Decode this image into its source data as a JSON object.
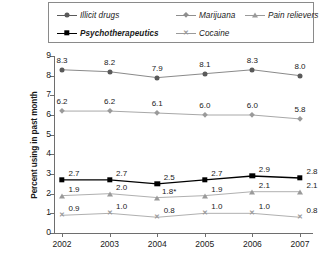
{
  "legend": {
    "items": [
      {
        "label": "Illicit drugs",
        "marker": "circle",
        "color": "#5a5a5a",
        "bold": false,
        "row": 1,
        "left": 8
      },
      {
        "label": "Marijuana",
        "marker": "diamond",
        "color": "#8e8e8e",
        "bold": false,
        "row": 1,
        "left": 127
      },
      {
        "label": "Pain relievers",
        "marker": "triangle",
        "color": "#9a9a9a",
        "bold": false,
        "row": 1,
        "left": 196
      },
      {
        "label": "Psychotherapeutics",
        "marker": "square",
        "color": "#000000",
        "bold": true,
        "row": 2,
        "left": 8
      },
      {
        "label": "Cocaine",
        "marker": "x",
        "color": "#9a9a9a",
        "bold": false,
        "row": 2,
        "left": 127
      }
    ]
  },
  "chart_data": {
    "type": "line",
    "title": "",
    "xlabel": "",
    "ylabel": "Percent using in past month",
    "categories": [
      "2002",
      "2003",
      "2004",
      "2005",
      "2006",
      "2007"
    ],
    "ylim": [
      0,
      9
    ],
    "yticks": [
      "0",
      "1",
      "2",
      "3",
      "4",
      "5",
      "6",
      "7",
      "8",
      "9"
    ],
    "grid": false,
    "legend_position": "top",
    "footnote_symbol": "*",
    "series": [
      {
        "name": "Illicit drugs",
        "marker": "circle",
        "color": "#5a5a5a",
        "line_color": "#8a8a8a",
        "values": [
          8.3,
          8.2,
          7.9,
          8.1,
          8.3,
          8.0
        ],
        "labels": [
          "8.3",
          "8.2",
          "7.9",
          "8.1",
          "8.3",
          "8.0"
        ],
        "label_side": "above"
      },
      {
        "name": "Marijuana",
        "marker": "diamond",
        "color": "#9a9a9a",
        "line_color": "#a8a8a8",
        "values": [
          6.2,
          6.2,
          6.1,
          6.0,
          6.0,
          5.8
        ],
        "labels": [
          "6.2",
          "6.2",
          "6.1",
          "6.0",
          "6.0",
          "5.8"
        ],
        "label_side": "above"
      },
      {
        "name": "Psychotherapeutics",
        "marker": "square",
        "color": "#000000",
        "line_color": "#000000",
        "values": [
          2.7,
          2.7,
          2.5,
          2.7,
          2.9,
          2.8
        ],
        "labels": [
          "2.7",
          "2.7",
          "2.5",
          "2.7",
          "2.9",
          "2.8"
        ],
        "label_side": "above-right"
      },
      {
        "name": "Pain relievers",
        "marker": "triangle",
        "color": "#9a9a9a",
        "line_color": "#b0b0b0",
        "values": [
          1.9,
          2.0,
          1.8,
          1.9,
          2.1,
          2.1
        ],
        "labels": [
          "1.9",
          "2.0",
          "1.8*",
          "1.9",
          "2.1",
          "2.1"
        ],
        "label_side": "above-right"
      },
      {
        "name": "Cocaine",
        "marker": "x",
        "color": "#9a9a9a",
        "line_color": "#b0b0b0",
        "values": [
          0.9,
          1.0,
          0.8,
          1.0,
          1.0,
          0.8
        ],
        "labels": [
          "0.9",
          "1.0",
          "0.8",
          "1.0",
          "1.0",
          "0.8"
        ],
        "label_side": "above-right"
      }
    ]
  }
}
